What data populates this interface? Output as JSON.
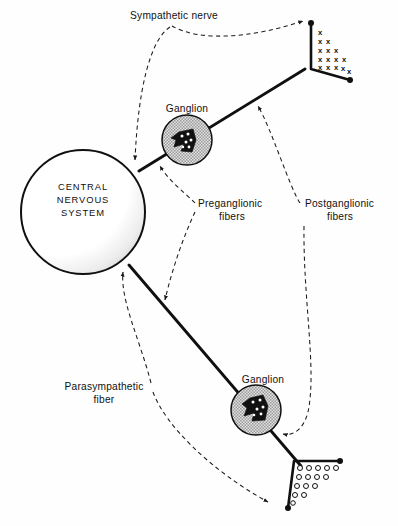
{
  "figure": {
    "background_color": "#ffffff",
    "ink_color": "#111111",
    "ganglion_fill_color": "#c9c9c9",
    "cns_shadow_color": "#d0d0d0"
  },
  "labels": {
    "sympathetic_nerve": "Sympathetic nerve",
    "ganglion_upper": "Ganglion",
    "ganglion_lower": "Ganglion",
    "preganglionic_line1": "Preganglionic",
    "preganglionic_line2": "fibers",
    "postganglionic_line1": "Postganglionic",
    "postganglionic_line2": "fibers",
    "parasympathetic_line1": "Parasympathetic",
    "parasympathetic_line2": "fiber",
    "cns_line1": "CENTRAL",
    "cns_line2": "NERVOUS",
    "cns_line3": "SYSTEM"
  },
  "structures": {
    "cns": {
      "name": "central-nervous-system",
      "shape": "circle",
      "center_x": 83,
      "center_y": 212,
      "radius": 62
    },
    "ganglion_upper": {
      "name": "sympathetic-ganglion",
      "center_x": 187,
      "center_y": 140,
      "radius": 25
    },
    "ganglion_lower": {
      "name": "parasympathetic-ganglion",
      "center_x": 256,
      "center_y": 410,
      "radius": 25
    },
    "effector_upper": {
      "name": "sympathetic-effector-organ",
      "marker": "x",
      "marker_rows": [
        1,
        2,
        3,
        4,
        5
      ]
    },
    "effector_lower": {
      "name": "parasympathetic-effector-organ",
      "marker": "circle",
      "marker_rows": [
        5,
        4,
        3,
        2,
        1
      ]
    }
  },
  "pathways": [
    {
      "name": "sympathetic-pathway",
      "preganglionic": "CNS to sympathetic ganglion",
      "postganglionic": "sympathetic ganglion to effector organ"
    },
    {
      "name": "parasympathetic-pathway",
      "preganglionic": "CNS to parasympathetic ganglion",
      "postganglionic": "parasympathetic ganglion to effector organ"
    }
  ]
}
